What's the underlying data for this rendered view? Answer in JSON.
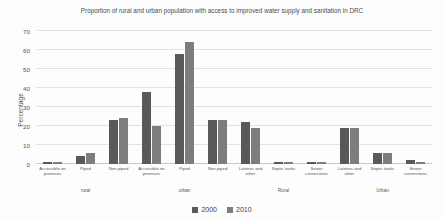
{
  "chart_data": {
    "type": "bar",
    "title": "Proportion of rural and urban population with access to improved water supply and sanitation in DRC",
    "xlabel": "",
    "ylabel": "Percentage",
    "ylim": [
      0,
      70
    ],
    "ytick_step": 10,
    "yticks": [
      0,
      10,
      20,
      30,
      40,
      50,
      60,
      70
    ],
    "grid": true,
    "legend_position": "bottom",
    "categories": [
      "Accessible on premises",
      "Piped",
      "Non piped",
      "Accessible on premises",
      "Piped",
      "Non piped",
      "Latrines and other",
      "Septic tanks",
      "Sewer connections",
      "Latrines and other",
      "Septic tanks",
      "Sewer connections"
    ],
    "sections": [
      {
        "label": "rural",
        "start": 0,
        "end": 2
      },
      {
        "label": "urban",
        "start": 3,
        "end": 5
      },
      {
        "label": "Rural",
        "start": 6,
        "end": 8
      },
      {
        "label": "Urban",
        "start": 9,
        "end": 11
      }
    ],
    "series": [
      {
        "name": "2000",
        "color": "#595959",
        "values": [
          1,
          4,
          23,
          38,
          58,
          23,
          22,
          1,
          1,
          19,
          6,
          2
        ]
      },
      {
        "name": "2010",
        "color": "#7d7d7d",
        "values": [
          1,
          6,
          24,
          20,
          64,
          23,
          19,
          1,
          1,
          19,
          6,
          1
        ]
      }
    ]
  },
  "legend": {
    "items": [
      {
        "label": "2000"
      },
      {
        "label": "2010"
      }
    ]
  }
}
